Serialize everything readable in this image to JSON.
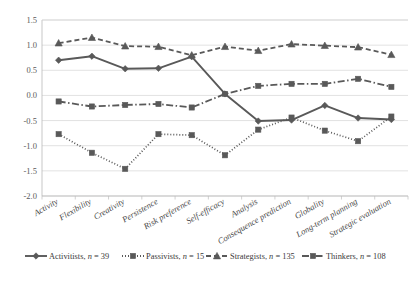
{
  "chart_data": {
    "type": "line",
    "title": "",
    "subtitle": "",
    "xlabel": "",
    "ylabel": "",
    "ylim": [
      -2.0,
      1.5
    ],
    "ytick_values": [
      1.5,
      1.0,
      0.5,
      0.0,
      -0.5,
      -1.0,
      -1.5,
      -2.0
    ],
    "ytick_labels": [
      "1.5",
      "1.0",
      "0.5",
      "0.0",
      "-0.5",
      "-1.0",
      "-1.5",
      "-2.0"
    ],
    "grid": true,
    "legend_position": "bottom",
    "categories": [
      "Activity",
      "Flexibility",
      "Creativity",
      "Persistence",
      "Risk preference",
      "Self-efficacy",
      "Analysis",
      "Consequence prediction",
      "Globality",
      "Long-term planning",
      "Strategic evaluation"
    ],
    "series": [
      {
        "name": "Activitists",
        "n": 39,
        "legend_label": "Activitists, n = 39",
        "marker": "diamond",
        "linestyle": "solid",
        "color": "#595959",
        "values": [
          0.7,
          0.78,
          0.53,
          0.54,
          0.77,
          0.03,
          -0.51,
          -0.49,
          -0.2,
          -0.45,
          -0.48
        ]
      },
      {
        "name": "Passivists",
        "n": 15,
        "legend_label": "Passivists, n = 15",
        "marker": "square",
        "linestyle": "dotted",
        "color": "#595959",
        "values": [
          -0.77,
          -1.14,
          -1.46,
          -0.77,
          -0.79,
          -1.19,
          -0.68,
          -0.44,
          -0.7,
          -0.91,
          -0.42
        ]
      },
      {
        "name": "Strategists",
        "n": 135,
        "legend_label": "Strategists, n = 135",
        "marker": "triangle",
        "linestyle": "dashed",
        "color": "#595959",
        "values": [
          1.04,
          1.15,
          0.98,
          0.97,
          0.8,
          0.97,
          0.89,
          1.02,
          0.99,
          0.96,
          0.81
        ]
      },
      {
        "name": "Thinkers",
        "n": 108,
        "legend_label": "Thinkers, n = 108",
        "marker": "square",
        "linestyle": "dashdot",
        "color": "#595959",
        "values": [
          -0.12,
          -0.22,
          -0.19,
          -0.17,
          -0.24,
          0.03,
          0.19,
          0.23,
          0.23,
          0.33,
          0.17
        ]
      }
    ]
  },
  "legend": {
    "items": [
      {
        "label": "Activitists, n = 39",
        "name_part": "Activitists, ",
        "n_part": "n",
        "eq_part": " = 39"
      },
      {
        "label": "Passivists, n = 15",
        "name_part": "Passivists, ",
        "n_part": "n",
        "eq_part": " = 15"
      },
      {
        "label": "Strategists, n = 135",
        "name_part": "Strategists, ",
        "n_part": "n",
        "eq_part": " = 135"
      },
      {
        "label": "Thinkers, n = 108",
        "name_part": "Thinkers, ",
        "n_part": "n",
        "eq_part": " = 108"
      }
    ]
  }
}
